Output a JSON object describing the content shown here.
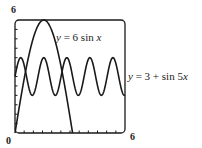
{
  "chart_data": {
    "type": "line",
    "title": "",
    "xlabel": "",
    "ylabel": "",
    "xlim": [
      0,
      6
    ],
    "ylim": [
      0,
      6
    ],
    "grid": false,
    "x_tick_labels": [
      "0",
      "6"
    ],
    "y_tick_labels": [
      "6"
    ],
    "x_minor_ticks_step": 0.5,
    "y_minor_ticks_step": 0.5,
    "series": [
      {
        "name": "y = 6 sin x",
        "expression": "6*sin(x)",
        "x": [
          0,
          0.5,
          1.0,
          1.5708,
          2.0,
          2.5,
          3.0,
          3.1416
        ],
        "values": [
          0,
          2.88,
          5.05,
          6.0,
          5.46,
          3.59,
          0.85,
          0
        ]
      },
      {
        "name": "y = 3 + sin 5x",
        "expression": "3+sin(5*x)",
        "x": [
          0,
          0.314,
          0.628,
          0.942,
          1.257,
          1.571,
          1.885,
          2.199,
          2.513,
          2.827,
          3.142,
          3.456,
          3.77,
          4.084,
          4.398,
          4.712,
          5.027,
          5.341,
          5.655,
          5.969,
          6.0
        ],
        "values": [
          3,
          4,
          3,
          2,
          3,
          4,
          3,
          2,
          3,
          4,
          3,
          2,
          3,
          4,
          3,
          2,
          3,
          4,
          3,
          2,
          2.01
        ]
      }
    ],
    "annotations": [
      {
        "text": "y = 6 sin x",
        "near": "peak of 6 sin x"
      },
      {
        "text": "y = 3 + sin 5x",
        "position": "right of plot"
      }
    ]
  },
  "labels": {
    "y_max": "6",
    "x_min": "0",
    "x_max": "6",
    "curve1_y": "y",
    "curve1_rest": " = 6 sin ",
    "curve1_x": "x",
    "curve2_y": "y",
    "curve2_rest": " = 3 + sin 5",
    "curve2_x": "x"
  },
  "colors": {
    "line": "#1a1a1a",
    "frame": "#1a1a1a",
    "background": "#ffffff"
  }
}
